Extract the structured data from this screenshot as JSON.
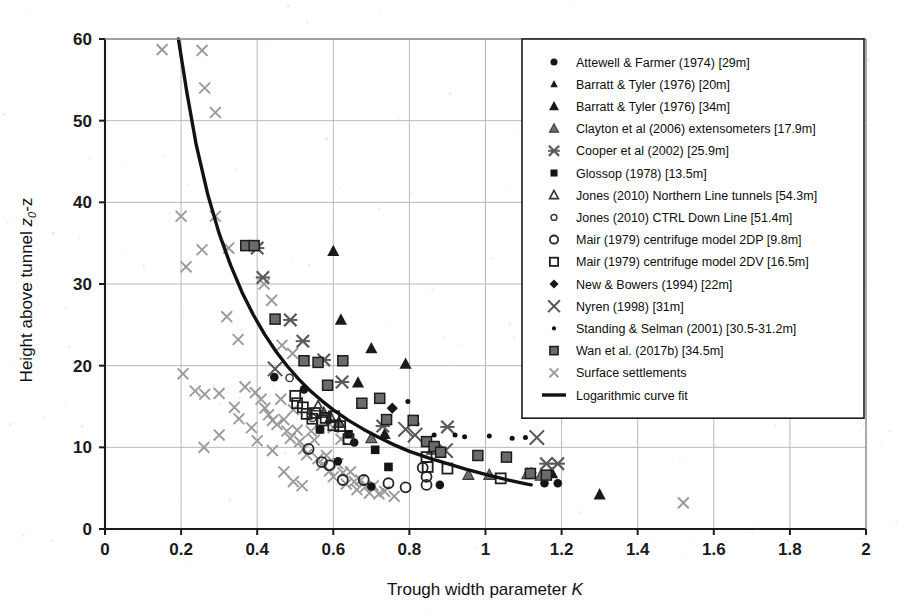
{
  "chart_data": {
    "type": "scatter",
    "title": "",
    "xlabel": "Trough width parameter K",
    "ylabel": "Height above tunnel z0-z",
    "xlim": [
      0,
      2
    ],
    "ylim": [
      0,
      60
    ],
    "xticks": [
      "0",
      "0.2",
      "0.4",
      "0.6",
      "0.8",
      "1",
      "1.2",
      "1.4",
      "1.6",
      "1.8",
      "2"
    ],
    "yticks": [
      "0",
      "10",
      "20",
      "30",
      "40",
      "50",
      "60"
    ],
    "grid": true,
    "legend_position": "upper right",
    "series": [
      {
        "name": "Attewell & Farmer (1974) [29m]",
        "marker": "filled-circle",
        "color": "#151515",
        "points": [
          [
            0.445,
            18.6
          ],
          [
            0.523,
            17.1
          ],
          [
            0.565,
            12.2
          ],
          [
            0.612,
            8.3
          ],
          [
            0.655,
            10.6
          ],
          [
            0.7,
            5.2
          ],
          [
            0.88,
            5.4
          ],
          [
            1.155,
            5.6
          ],
          [
            1.19,
            5.6
          ]
        ]
      },
      {
        "name": "Barratt & Tyler (1976) [20m]",
        "marker": "filled-triangle",
        "color": "#1a1a1a",
        "points": [
          [
            0.665,
            17.9
          ],
          [
            0.735,
            11.6
          ],
          [
            1.3,
            4.2
          ]
        ]
      },
      {
        "name": "Barratt & Tyler (1976) [34m]",
        "marker": "filled-triangle",
        "color": "#1a1a1a",
        "points": [
          [
            0.6,
            34.0
          ],
          [
            0.62,
            25.6
          ],
          [
            0.7,
            22.1
          ],
          [
            0.79,
            20.2
          ],
          [
            1.175,
            6.8
          ]
        ]
      },
      {
        "name": "Clayton et al (2006) extensometers [17.9m]",
        "marker": "open-triangle-gray",
        "color": "#6e6e6e",
        "points": [
          [
            0.575,
            14.2
          ],
          [
            0.615,
            13.0
          ],
          [
            0.7,
            11.1
          ],
          [
            0.86,
            9.7
          ],
          [
            0.955,
            6.6
          ],
          [
            1.01,
            6.6
          ],
          [
            1.11,
            6.7
          ],
          [
            1.145,
            6.5
          ]
        ]
      },
      {
        "name": "Cooper et al (2002) [25.9m]",
        "marker": "cross-x",
        "color": "#5a5a5a",
        "points": [
          [
            0.4,
            34.4
          ],
          [
            0.415,
            30.8
          ],
          [
            0.487,
            25.6
          ],
          [
            0.52,
            23.0
          ],
          [
            0.575,
            20.7
          ],
          [
            0.623,
            18.0
          ],
          [
            0.73,
            12.6
          ],
          [
            0.9,
            12.5
          ],
          [
            1.16,
            8.0
          ],
          [
            1.19,
            8.0
          ]
        ]
      },
      {
        "name": "Glossop (1978) [13.5m]",
        "marker": "filled-square",
        "color": "#141414",
        "points": [
          [
            0.565,
            12.2
          ],
          [
            0.64,
            11.6
          ],
          [
            0.71,
            9.7
          ],
          [
            0.745,
            7.6
          ]
        ]
      },
      {
        "name": "Jones (2010) Northern Line tunnels [54.3m]",
        "marker": "open-triangle",
        "color": "#333333",
        "points": [
          [
            0.56,
            15.0
          ],
          [
            0.593,
            13.6
          ],
          [
            0.615,
            13.0
          ]
        ]
      },
      {
        "name": "Jones (2010) CTRL Down Line [51.4m]",
        "marker": "small-open-circle",
        "color": "#3b3b3b",
        "points": [
          [
            0.485,
            18.5
          ],
          [
            0.545,
            13.6
          ]
        ]
      },
      {
        "name": "Mair (1979) centrifuge model 2DP [9.8m]",
        "marker": "open-circle",
        "color": "#262626",
        "points": [
          [
            0.535,
            9.8
          ],
          [
            0.57,
            8.2
          ],
          [
            0.59,
            7.8
          ],
          [
            0.625,
            6.0
          ],
          [
            0.68,
            6.0
          ],
          [
            0.745,
            5.6
          ],
          [
            0.79,
            5.1
          ],
          [
            0.835,
            7.5
          ],
          [
            0.845,
            6.4
          ],
          [
            0.845,
            5.4
          ]
        ]
      },
      {
        "name": "Mair (1979) centrifuge model 2DV [16.5m]",
        "marker": "open-square",
        "color": "#1f1f1f",
        "points": [
          [
            0.5,
            16.3
          ],
          [
            0.505,
            15.4
          ],
          [
            0.52,
            14.9
          ],
          [
            0.53,
            14.1
          ],
          [
            0.545,
            13.5
          ],
          [
            0.552,
            14.2
          ],
          [
            0.57,
            13.3
          ],
          [
            0.58,
            13.6
          ],
          [
            0.6,
            12.7
          ],
          [
            0.602,
            13.8
          ],
          [
            0.618,
            12.6
          ],
          [
            0.64,
            11.0
          ],
          [
            0.845,
            8.8
          ],
          [
            0.848,
            7.6
          ],
          [
            0.9,
            7.4
          ],
          [
            1.04,
            6.2
          ]
        ]
      },
      {
        "name": "New & Bowers (1994) [22m]",
        "marker": "filled-diamond",
        "color": "#161616",
        "points": [
          [
            0.755,
            14.8
          ],
          [
            1.12,
            6.9
          ]
        ]
      },
      {
        "name": "Nyren (1998) [31m]",
        "marker": "big-x",
        "color": "#555555",
        "points": [
          [
            0.447,
            19.6
          ],
          [
            0.79,
            12.2
          ],
          [
            0.815,
            11.5
          ],
          [
            0.895,
            9.6
          ],
          [
            1.135,
            11.2
          ]
        ]
      },
      {
        "name": "Standing & Selman (2001) [30.5-31.2m]",
        "marker": "small-dot",
        "color": "#101010",
        "points": [
          [
            0.796,
            15.6
          ],
          [
            0.82,
            12.9
          ],
          [
            0.865,
            11.5
          ],
          [
            0.92,
            11.5
          ],
          [
            0.945,
            11.3
          ],
          [
            1.01,
            11.4
          ],
          [
            1.07,
            11.1
          ],
          [
            1.105,
            11.2
          ]
        ]
      },
      {
        "name": "Wan et al. (2017b) [34.5m]",
        "marker": "gray-square",
        "color": "#6b6b6b",
        "points": [
          [
            0.37,
            34.7
          ],
          [
            0.392,
            34.7
          ],
          [
            0.447,
            25.7
          ],
          [
            0.523,
            20.6
          ],
          [
            0.56,
            20.4
          ],
          [
            0.585,
            17.6
          ],
          [
            0.625,
            20.6
          ],
          [
            0.675,
            15.4
          ],
          [
            0.722,
            16.0
          ],
          [
            0.74,
            13.4
          ],
          [
            0.81,
            13.3
          ],
          [
            0.845,
            10.7
          ],
          [
            0.865,
            10.1
          ],
          [
            0.882,
            9.4
          ],
          [
            0.98,
            9.0
          ],
          [
            1.055,
            8.8
          ],
          [
            1.118,
            6.8
          ],
          [
            1.16,
            6.6
          ]
        ]
      },
      {
        "name": "Surface settlements",
        "marker": "gray-x",
        "color": "#9a9a9a",
        "points": [
          [
            0.15,
            58.7
          ],
          [
            0.255,
            58.6
          ],
          [
            0.262,
            54.0
          ],
          [
            0.29,
            51.0
          ],
          [
            0.2,
            38.3
          ],
          [
            0.29,
            38.3
          ],
          [
            0.213,
            32.1
          ],
          [
            0.255,
            34.2
          ],
          [
            0.325,
            34.4
          ],
          [
            0.375,
            34.7
          ],
          [
            0.205,
            19.0
          ],
          [
            0.237,
            16.9
          ],
          [
            0.262,
            16.5
          ],
          [
            0.3,
            16.6
          ],
          [
            0.34,
            14.9
          ],
          [
            0.352,
            13.5
          ],
          [
            0.368,
            17.4
          ],
          [
            0.395,
            16.7
          ],
          [
            0.41,
            15.9
          ],
          [
            0.42,
            14.8
          ],
          [
            0.43,
            14.0
          ],
          [
            0.44,
            13.3
          ],
          [
            0.452,
            12.8
          ],
          [
            0.462,
            15.9
          ],
          [
            0.47,
            13.4
          ],
          [
            0.478,
            12.0
          ],
          [
            0.487,
            11.1
          ],
          [
            0.495,
            14.6
          ],
          [
            0.505,
            12.1
          ],
          [
            0.512,
            10.7
          ],
          [
            0.522,
            9.8
          ],
          [
            0.53,
            9.1
          ],
          [
            0.542,
            12.0
          ],
          [
            0.55,
            10.9
          ],
          [
            0.56,
            8.6
          ],
          [
            0.57,
            7.8
          ],
          [
            0.582,
            9.0
          ],
          [
            0.59,
            7.1
          ],
          [
            0.6,
            6.4
          ],
          [
            0.612,
            8.0
          ],
          [
            0.625,
            6.9
          ],
          [
            0.634,
            5.5
          ],
          [
            0.645,
            7.0
          ],
          [
            0.655,
            5.8
          ],
          [
            0.662,
            4.8
          ],
          [
            0.672,
            6.0
          ],
          [
            0.685,
            5.2
          ],
          [
            0.695,
            4.4
          ],
          [
            0.705,
            5.3
          ],
          [
            0.72,
            4.3
          ],
          [
            0.735,
            4.6
          ],
          [
            0.76,
            4.0
          ],
          [
            0.465,
            22.5
          ],
          [
            0.493,
            21.5
          ],
          [
            0.35,
            23.2
          ],
          [
            0.32,
            26.0
          ],
          [
            0.438,
            28.0
          ],
          [
            0.418,
            30.0
          ],
          [
            0.47,
            7.0
          ],
          [
            0.44,
            9.6
          ],
          [
            0.4,
            10.8
          ],
          [
            0.385,
            12.4
          ],
          [
            0.495,
            5.8
          ],
          [
            0.518,
            5.3
          ],
          [
            0.3,
            11.5
          ],
          [
            0.26,
            10.0
          ],
          [
            0.6,
            12.4
          ],
          [
            0.62,
            11.0
          ],
          [
            1.52,
            3.2
          ]
        ]
      }
    ],
    "fit": {
      "name": "Logarithmic curve fit",
      "style": "solid",
      "color": "#121212",
      "points": [
        [
          0.193,
          60.0
        ],
        [
          0.215,
          53.5
        ],
        [
          0.24,
          47.0
        ],
        [
          0.27,
          41.0
        ],
        [
          0.3,
          36.2
        ],
        [
          0.33,
          32.3
        ],
        [
          0.36,
          29.0
        ],
        [
          0.39,
          26.2
        ],
        [
          0.42,
          23.8
        ],
        [
          0.45,
          21.7
        ],
        [
          0.48,
          19.9
        ],
        [
          0.51,
          18.3
        ],
        [
          0.54,
          16.9
        ],
        [
          0.57,
          15.7
        ],
        [
          0.6,
          14.6
        ],
        [
          0.64,
          13.3
        ],
        [
          0.68,
          12.2
        ],
        [
          0.72,
          11.2
        ],
        [
          0.76,
          10.3
        ],
        [
          0.8,
          9.5
        ],
        [
          0.85,
          8.7
        ],
        [
          0.9,
          8.0
        ],
        [
          0.95,
          7.3
        ],
        [
          1.0,
          6.7
        ],
        [
          1.05,
          6.1
        ],
        [
          1.1,
          5.6
        ],
        [
          1.12,
          5.4
        ]
      ]
    }
  },
  "legend": {
    "entries": [
      {
        "label": "Attewell & Farmer (1974) [29m]",
        "marker": "filled-circle"
      },
      {
        "label": "Barratt & Tyler (1976) [20m]",
        "marker": "filled-triangle-small"
      },
      {
        "label": "Barratt & Tyler (1976) [34m]",
        "marker": "filled-triangle"
      },
      {
        "label": "Clayton et al (2006) extensometers [17.9m]",
        "marker": "open-triangle-gray"
      },
      {
        "label": "Cooper et al (2002) [25.9m]",
        "marker": "cross-x"
      },
      {
        "label": "Glossop (1978) [13.5m]",
        "marker": "filled-square"
      },
      {
        "label": "Jones (2010) Northern Line tunnels [54.3m]",
        "marker": "open-triangle"
      },
      {
        "label": "Jones (2010) CTRL Down Line [51.4m]",
        "marker": "small-open-circle"
      },
      {
        "label": "Mair (1979) centrifuge model 2DP [9.8m]",
        "marker": "open-circle"
      },
      {
        "label": "Mair (1979) centrifuge model 2DV [16.5m]",
        "marker": "open-square"
      },
      {
        "label": "New & Bowers (1994) [22m]",
        "marker": "filled-diamond"
      },
      {
        "label": "Nyren (1998) [31m]",
        "marker": "big-x"
      },
      {
        "label": "Standing & Selman (2001) [30.5-31.2m]",
        "marker": "small-dot"
      },
      {
        "label": "Wan et al. (2017b) [34.5m]",
        "marker": "gray-square"
      },
      {
        "label": "Surface settlements",
        "marker": "gray-x"
      },
      {
        "label": "Logarithmic curve fit",
        "marker": "line"
      }
    ]
  },
  "axes": {
    "x_title_main": "Trough  width parameter ",
    "x_title_symbol": "K",
    "y_title_main": "Height above tunnel ",
    "y_title_symbol": "z",
    "y_title_sub": "0",
    "y_title_tail": "-z"
  },
  "colors": {
    "axis": "#1c1c1c",
    "grid": "#b9b9b9",
    "curve": "#121212",
    "gray_marker": "#6b6b6b",
    "light_gray_marker": "#9a9a9a",
    "background": "#ffffff"
  }
}
